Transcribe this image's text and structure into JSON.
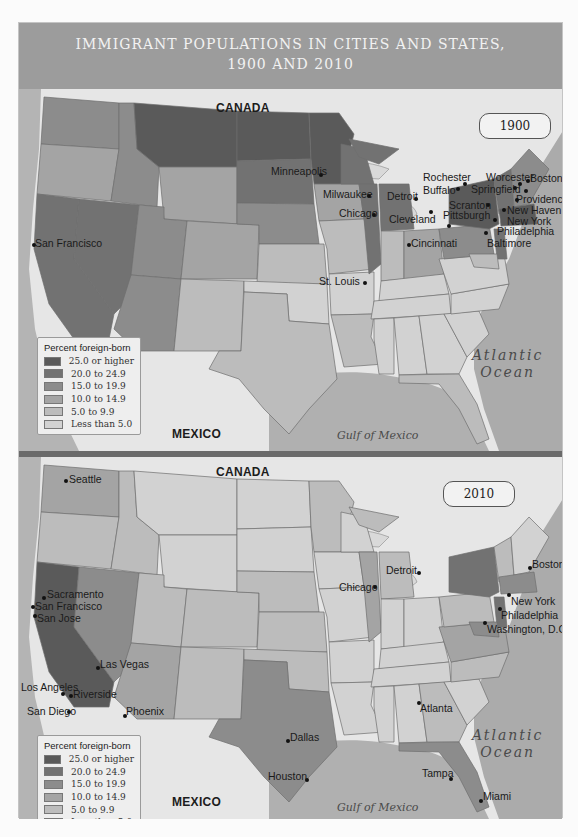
{
  "title": {
    "line1": "IMMIGRANT POPULATIONS IN CITIES AND STATES,",
    "line2": "1900 AND 2010"
  },
  "legend": {
    "title": "Percent foreign-born",
    "items": [
      {
        "label": "25.0 or higher",
        "color": "#5a5a5a"
      },
      {
        "label": "20.0 to 24.9",
        "color": "#727272"
      },
      {
        "label": "15.0 to 19.9",
        "color": "#8c8c8c"
      },
      {
        "label": "10.0 to 14.9",
        "color": "#a4a4a4"
      },
      {
        "label": "5.0 to 9.9",
        "color": "#bcbcbc"
      },
      {
        "label": "Less than 5.0",
        "color": "#d2d2d2"
      }
    ]
  },
  "colors": {
    "land_outside": "#e8e8e8",
    "ocean": "#a8a8a8",
    "frame": "#9c9c9c",
    "state_border": "#6e6e6e"
  },
  "maps": [
    {
      "year": "1900",
      "labels": {
        "canada": "CANADA",
        "mexico": "MEXICO",
        "atlantic_line1": "Atlantic",
        "atlantic_line2": "Ocean",
        "gulf": "Gulf of Mexico"
      },
      "cities": [
        {
          "name": "San Francisco"
        },
        {
          "name": "Minneapolis"
        },
        {
          "name": "Milwaukee"
        },
        {
          "name": "Chicago"
        },
        {
          "name": "St. Louis"
        },
        {
          "name": "Detroit"
        },
        {
          "name": "Cleveland"
        },
        {
          "name": "Cincinnati"
        },
        {
          "name": "Rochester"
        },
        {
          "name": "Buffalo"
        },
        {
          "name": "Pittsburgh"
        },
        {
          "name": "Scranton"
        },
        {
          "name": "Worcester"
        },
        {
          "name": "Springfield"
        },
        {
          "name": "Boston"
        },
        {
          "name": "Providence"
        },
        {
          "name": "New Haven"
        },
        {
          "name": "New York"
        },
        {
          "name": "Philadelphia"
        },
        {
          "name": "Baltimore"
        }
      ]
    },
    {
      "year": "2010",
      "labels": {
        "canada": "CANADA",
        "mexico": "MEXICO",
        "atlantic_line1": "Atlantic",
        "atlantic_line2": "Ocean",
        "gulf": "Gulf of Mexico"
      },
      "cities": [
        {
          "name": "Seattle"
        },
        {
          "name": "Sacramento"
        },
        {
          "name": "San Francisco"
        },
        {
          "name": "San Jose"
        },
        {
          "name": "Las Vegas"
        },
        {
          "name": "Los Angeles"
        },
        {
          "name": "Riverside"
        },
        {
          "name": "San Diego"
        },
        {
          "name": "Phoenix"
        },
        {
          "name": "Dallas"
        },
        {
          "name": "Houston"
        },
        {
          "name": "Chicago"
        },
        {
          "name": "Detroit"
        },
        {
          "name": "Atlanta"
        },
        {
          "name": "Tampa"
        },
        {
          "name": "Miami"
        },
        {
          "name": "Boston"
        },
        {
          "name": "New York"
        },
        {
          "name": "Philadelphia"
        },
        {
          "name": "Washington, D.C."
        }
      ]
    }
  ]
}
